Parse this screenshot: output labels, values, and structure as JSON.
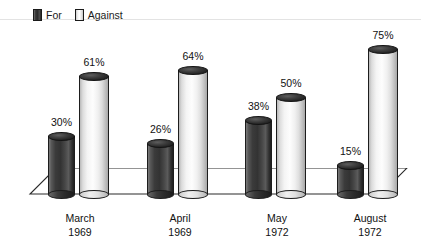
{
  "legend": {
    "entries": [
      {
        "label": "For",
        "swatch": "dark-cylinder-swatch",
        "color": "#333333"
      },
      {
        "label": "Against",
        "swatch": "light-cylinder-swatch",
        "color": "#f2f2f2"
      }
    ]
  },
  "chart_data": {
    "type": "bar",
    "title": "",
    "subtitle": "",
    "xlabel": "",
    "ylabel": "",
    "ylim": [
      0,
      80
    ],
    "grid": false,
    "legend_position": "top-left",
    "style": "3d-cylinder",
    "categories": [
      "March 1969",
      "April 1969",
      "May 1972",
      "August 1972"
    ],
    "category_lines": [
      {
        "month": "March",
        "year": "1969"
      },
      {
        "month": "April",
        "year": "1969"
      },
      {
        "month": "May",
        "year": "1972"
      },
      {
        "month": "August",
        "year": "1972"
      }
    ],
    "series": [
      {
        "name": "For",
        "color": "#333333",
        "values": [
          30,
          26,
          38,
          15
        ],
        "labels": [
          "30%",
          "26%",
          "38%",
          "15%"
        ]
      },
      {
        "name": "Against",
        "color": "#f2f2f2",
        "values": [
          61,
          64,
          50,
          75
        ],
        "labels": [
          "61%",
          "64%",
          "50%",
          "75%"
        ]
      }
    ]
  },
  "colors": {
    "background": "#ffffff",
    "floor": "#ffffff",
    "outline": "#1d1d1d",
    "text": "#111111",
    "rule": "#e3e3e3"
  }
}
